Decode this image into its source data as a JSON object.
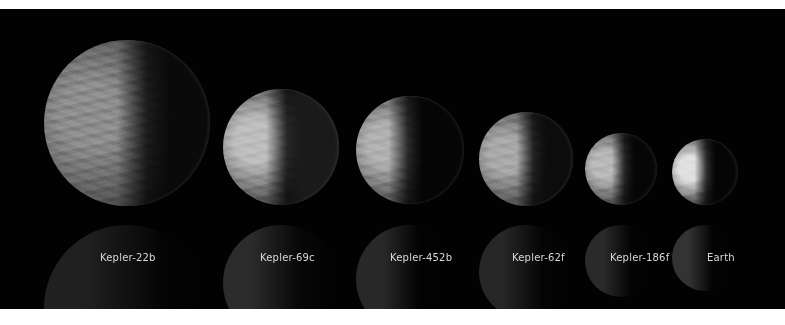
{
  "scene": {
    "background": "#020202",
    "frame_color": "#ffffff",
    "planets": [
      {
        "name": "Kepler-22b",
        "cx": 127,
        "cy": 114,
        "r": 83,
        "lit_color": "#8c8c8c",
        "dark_color": "#0a0a0a",
        "terminator": 62,
        "label_x": 100,
        "label_y": 243
      },
      {
        "name": "Kepler-69c",
        "cx": 281,
        "cy": 138,
        "r": 58,
        "lit_color": "#bdbdbd",
        "dark_color": "#1a1a1a",
        "terminator": 55,
        "label_x": 260,
        "label_y": 243
      },
      {
        "name": "Kepler-452b",
        "cx": 410,
        "cy": 141,
        "r": 54,
        "lit_color": "#b0b0b0",
        "dark_color": "#050505",
        "terminator": 48,
        "label_x": 390,
        "label_y": 243
      },
      {
        "name": "Kepler-62f",
        "cx": 526,
        "cy": 150,
        "r": 47,
        "lit_color": "#a8a8a8",
        "dark_color": "#0c0c0c",
        "terminator": 58,
        "label_x": 512,
        "label_y": 243
      },
      {
        "name": "Kepler-186f",
        "cx": 621,
        "cy": 160,
        "r": 36,
        "lit_color": "#b8b8b8",
        "dark_color": "#060606",
        "terminator": 55,
        "label_x": 610,
        "label_y": 243
      },
      {
        "name": "Earth",
        "cx": 705,
        "cy": 163,
        "r": 33,
        "lit_color": "#e0e0e0",
        "dark_color": "#050505",
        "terminator": 52,
        "label_x": 707,
        "label_y": 243
      }
    ]
  }
}
